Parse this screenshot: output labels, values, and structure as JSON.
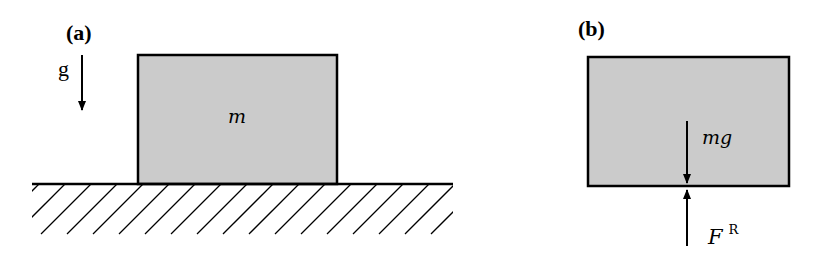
{
  "figure": {
    "background": "#ffffff",
    "block_fill": "#cbcbcb",
    "stroke_color": "#000000"
  },
  "panel_a": {
    "label": "(a)",
    "gravity_label": "g",
    "mass_label": "m",
    "block": {
      "x": 138,
      "y": 55,
      "width": 199,
      "height": 129
    },
    "ground": {
      "x1": 32,
      "x2": 453,
      "y": 184
    },
    "hatch": {
      "spacing": 26,
      "start_x": 39,
      "count": 16,
      "depth": 50
    },
    "gravity_arrow": {
      "x": 82,
      "y1": 55,
      "y2": 112
    }
  },
  "panel_b": {
    "label": "(b)",
    "weight_label": "mg",
    "reaction_label_base": "F",
    "reaction_label_sup": "R",
    "block": {
      "x": 588,
      "y": 57,
      "width": 201,
      "height": 129
    },
    "weight_arrow": {
      "x": 687,
      "y1": 121,
      "y2": 185
    },
    "reaction_arrow": {
      "x": 687,
      "y1": 246,
      "y2": 187
    }
  }
}
